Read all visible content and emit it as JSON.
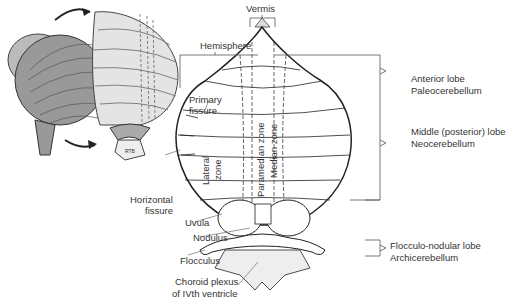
{
  "figure": {
    "labels": {
      "vermis": "Vermis",
      "hemisphere": "Hemisphere",
      "primary_fissure": [
        "Primary",
        "fissure"
      ],
      "horizontal_fissure": [
        "Horizontal",
        "fissure"
      ],
      "lateral_zone": [
        "Lateral",
        "zone"
      ],
      "paramedian_zone": "Paramedian zone",
      "median_zone": "Median zone",
      "uvula": "Uvula",
      "nodulus": "Nodulus",
      "flocculus": "Flocculus",
      "choroid_plexus": [
        "Choroid plexus",
        "of IVth ventricle"
      ]
    },
    "lobes": [
      {
        "name": "Anterior lobe",
        "alt": "Paleocerebellum"
      },
      {
        "name": "Middle (posterior) lobe",
        "alt": "Neocerebellum"
      },
      {
        "name": "Flocculo-nodular lobe",
        "alt": "Archicerebellum"
      }
    ],
    "inset_signature": "RTB"
  }
}
